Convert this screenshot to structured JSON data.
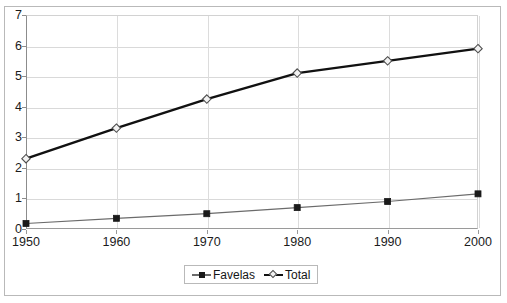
{
  "chart_data": {
    "type": "line",
    "title": "",
    "subtitle": "",
    "xlabel": "",
    "ylabel": "",
    "x": [
      1950,
      1960,
      1970,
      1980,
      1990,
      2000
    ],
    "xtick_labels": [
      "1950",
      "1960",
      "1970",
      "1980",
      "1990",
      "2000"
    ],
    "ytick_labels": [
      "0",
      "1",
      "2",
      "3",
      "4",
      "5",
      "6",
      "7"
    ],
    "ylim": [
      0,
      7
    ],
    "ytick_step": 1,
    "grid": "horizontal",
    "legend_position": "bottom-center",
    "series": [
      {
        "name": "Favelas",
        "marker": "square",
        "marker_color": "#1a1a1a",
        "line_color": "#6b6b6b",
        "line_width": 1.2,
        "values": [
          0.18,
          0.35,
          0.5,
          0.7,
          0.9,
          1.15
        ]
      },
      {
        "name": "Total",
        "marker": "diamond",
        "marker_color": "#f2f2f2",
        "marker_edge_color": "#4d4d4d",
        "line_color": "#111111",
        "line_width": 2.4,
        "values": [
          2.3,
          3.3,
          4.25,
          5.1,
          5.5,
          5.9
        ]
      }
    ]
  },
  "legend": {
    "entries": [
      {
        "label": "Favelas"
      },
      {
        "label": "Total"
      }
    ]
  },
  "colors": {
    "background": "#ffffff",
    "frame": "#b9b9b9",
    "gridline": "#d9d9d9",
    "axis": "#8c8c8c",
    "text": "#1b1b1b",
    "total_line": "#111111",
    "favelas_line": "#6b6b6b"
  }
}
